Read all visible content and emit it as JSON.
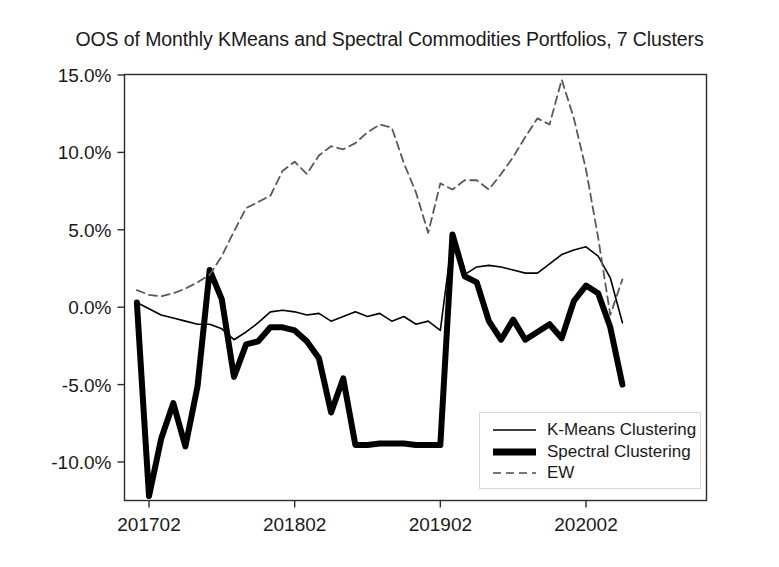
{
  "chart_data": {
    "type": "line",
    "title": "OOS of Monthly KMeans and Spectral Commodities Portfolios, 7 Clusters",
    "xlabel": "",
    "ylabel": "",
    "grid": false,
    "legend_position": "lower right",
    "ylim": [
      -13.5,
      16.0
    ],
    "yticks": [
      15.0,
      10.0,
      5.0,
      0.0,
      -5.0,
      -10.0
    ],
    "ytick_labels": [
      "15.0%",
      "10.0%",
      "5.0%",
      "0.0%",
      "-5.0%",
      "-10.0%"
    ],
    "xticks": [
      1,
      13,
      25,
      37
    ],
    "xtick_labels": [
      "201702",
      "201802",
      "201902",
      "202002"
    ],
    "x": [
      0,
      1,
      2,
      3,
      4,
      5,
      6,
      7,
      8,
      9,
      10,
      11,
      12,
      13,
      14,
      15,
      16,
      17,
      18,
      19,
      20,
      21,
      22,
      23,
      24,
      25,
      26,
      27,
      28,
      29,
      30,
      31,
      32,
      33,
      34,
      35,
      36,
      37,
      38,
      39,
      40
    ],
    "series": [
      {
        "name": "K-Means Clustering",
        "style": "solid",
        "linewidth": 1.6,
        "color": "#000000",
        "values": [
          0.3,
          -0.1,
          -0.5,
          -0.7,
          -0.9,
          -1.1,
          -1.1,
          -1.4,
          -2.1,
          -1.6,
          -1.0,
          -0.3,
          -0.2,
          -0.3,
          -0.5,
          -0.4,
          -0.9,
          -0.6,
          -0.3,
          -0.6,
          -0.4,
          -0.9,
          -0.6,
          -1.1,
          -0.9,
          -1.5,
          4.6,
          2.1,
          2.6,
          2.7,
          2.6,
          2.4,
          2.2,
          2.2,
          2.8,
          3.4,
          3.7,
          3.9,
          3.3,
          1.9,
          -1.0
        ]
      },
      {
        "name": "Spectral Clustering",
        "style": "solid",
        "linewidth": 6.0,
        "color": "#000000",
        "values": [
          0.3,
          -12.2,
          -8.5,
          -6.2,
          -9.0,
          -5.1,
          2.4,
          0.5,
          -4.5,
          -2.4,
          -2.2,
          -1.3,
          -1.3,
          -1.5,
          -2.2,
          -3.3,
          -6.8,
          -4.6,
          -8.9,
          -8.9,
          -8.8,
          -8.8,
          -8.8,
          -8.9,
          -8.9,
          -8.9,
          4.7,
          2.0,
          1.6,
          -0.9,
          -2.1,
          -0.8,
          -2.1,
          -1.6,
          -1.1,
          -2.0,
          0.4,
          1.4,
          0.9,
          -1.3,
          -5.0
        ]
      },
      {
        "name": "EW",
        "style": "dashed",
        "linewidth": 1.8,
        "color": "#595959",
        "values": [
          1.1,
          0.8,
          0.7,
          0.9,
          1.2,
          1.6,
          2.1,
          3.3,
          4.9,
          6.4,
          6.8,
          7.2,
          8.8,
          9.4,
          8.6,
          9.8,
          10.4,
          10.2,
          10.6,
          11.3,
          11.8,
          11.6,
          9.3,
          7.4,
          4.8,
          8.0,
          7.6,
          8.2,
          8.2,
          7.6,
          8.6,
          9.7,
          11.0,
          12.2,
          11.8,
          14.7,
          12.2,
          8.9,
          4.5,
          -0.5,
          1.8
        ]
      }
    ]
  },
  "legend": {
    "items": [
      {
        "label": "K-Means Clustering",
        "marker": "thin-solid-line"
      },
      {
        "label": "Spectral Clustering",
        "marker": "thick-solid-line"
      },
      {
        "label": "EW",
        "marker": "dashed-line"
      }
    ]
  },
  "colors": {
    "axis": "#2b2b2b",
    "text": "#1a1a1a",
    "kmeans": "#000000",
    "spectral": "#000000",
    "ew": "#595959",
    "background": "#ffffff"
  }
}
